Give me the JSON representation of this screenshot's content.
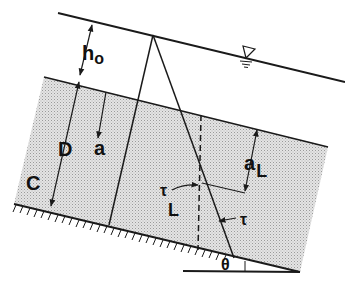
{
  "diagram": {
    "type": "sloping-layer-stress-diagram",
    "colors": {
      "line": "#1a1a1a",
      "fill_stipple": "#d9d9d9",
      "background": "#ffffff"
    },
    "labels": {
      "h0_main": "h",
      "h0_sub": "o",
      "D": "D",
      "a": "a",
      "C": "C",
      "aL_main": "a",
      "aL_sub": "L",
      "tauL_main": "τ",
      "tauL_sub": "L",
      "tau": "τ",
      "theta": "θ"
    },
    "symbols": {
      "water_surface": "inverted-triangle-water-level-icon"
    },
    "elements": [
      "free-surface-line",
      "layer-interface-line",
      "sloping-bed-with-hatching",
      "stress-distribution-triangle",
      "vertical-dashed-reference-line",
      "horizontal-reference-line",
      "slope-angle-theta"
    ]
  }
}
